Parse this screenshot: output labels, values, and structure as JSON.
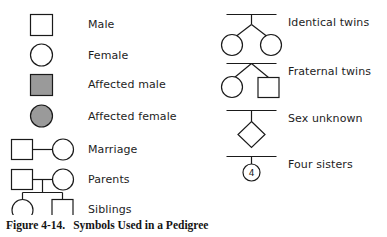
{
  "figure": {
    "caption_label": "Figure 4-14.",
    "caption_title": "Symbols Used in a Pedigree",
    "background_color": "#ffffff",
    "stroke_color": "#1a1a1a",
    "affected_fill_color": "#9a9a9a"
  },
  "legend": {
    "left_column": [
      {
        "key": "male",
        "label": "Male",
        "symbol": "square-outline"
      },
      {
        "key": "female",
        "label": "Female",
        "symbol": "circle-outline"
      },
      {
        "key": "affected-male",
        "label": "Affected male",
        "symbol": "square-filled"
      },
      {
        "key": "affected-female",
        "label": "Affected female",
        "symbol": "circle-filled"
      },
      {
        "key": "marriage",
        "label": "Marriage",
        "symbol": "square-line-circle"
      },
      {
        "key": "parents",
        "label": "Parents",
        "symbol": "square-line-circle-with-descent"
      },
      {
        "key": "siblings",
        "label": "Siblings",
        "symbol": "sibship-circle-square"
      }
    ],
    "right_column": [
      {
        "key": "identical-twins",
        "label": "Identical twins",
        "symbol": "sibline-stem-two-circles"
      },
      {
        "key": "fraternal-twins",
        "label": "Fraternal twins",
        "symbol": "sibline-fork-circle-square"
      },
      {
        "key": "sex-unknown",
        "label": "Sex unknown",
        "symbol": "diamond"
      },
      {
        "key": "four-sisters",
        "label": "Four sisters",
        "symbol": "circle-with-count"
      }
    ],
    "four_sisters_count": "4"
  }
}
